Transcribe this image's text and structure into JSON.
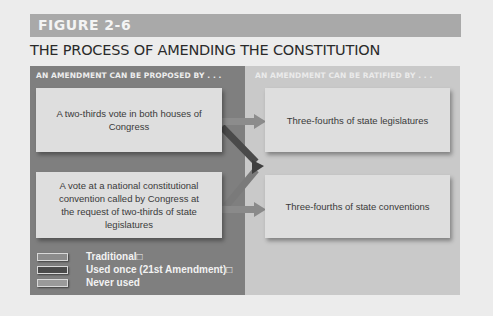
{
  "figure": {
    "label": "FIGURE 2-6",
    "title": "THE PROCESS OF AMENDING THE CONSTITUTION"
  },
  "panels": {
    "proposed": {
      "heading": "AN AMENDMENT CAN BE PROPOSED BY . . .",
      "boxes": [
        "A two-thirds vote in both houses of Congress",
        "A vote at a national constitutional convention called by Congress at the request of two-thirds of state legislatures"
      ]
    },
    "ratified": {
      "heading": "AN AMENDMENT CAN BE RATIFIED BY . . .",
      "boxes": [
        "Three-fourths of state legislatures",
        "Three-fourths of state conventions"
      ]
    }
  },
  "legend": [
    {
      "label": "Traditional□",
      "color": "#8c8c8c"
    },
    {
      "label": "Used once (21st Amendment)□",
      "color": "#4a4a4a"
    },
    {
      "label": "Never used",
      "color": "#9a9a9a"
    }
  ],
  "colors": {
    "header_bar": "#a9a9a9",
    "left_panel": "#7f7f7f",
    "right_panel": "#c9c9c9",
    "box": "#dedede",
    "arrow_traditional": "#8c8c8c",
    "arrow_used_once": "#4a4a4a",
    "arrow_never_used": "#9a9a9a"
  }
}
